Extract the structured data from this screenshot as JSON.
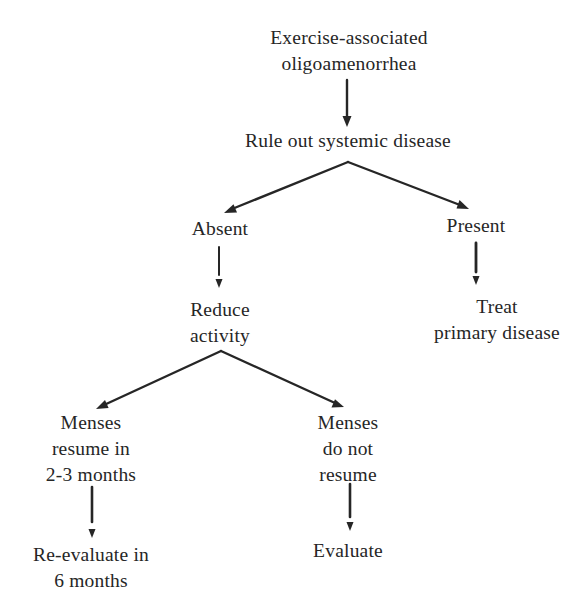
{
  "flowchart": {
    "title": "Exercise-associated oligoamenorrhea",
    "nodes": {
      "start": {
        "lines": [
          "Exercise-associated",
          "oligoamenorrhea"
        ]
      },
      "rule_out": {
        "lines": [
          "Rule out systemic disease"
        ]
      },
      "absent": {
        "lines": [
          "Absent"
        ]
      },
      "present": {
        "lines": [
          "Present"
        ]
      },
      "reduce_activity": {
        "lines": [
          "Reduce",
          "activity"
        ]
      },
      "treat_primary": {
        "lines": [
          "Treat",
          "primary disease"
        ]
      },
      "menses_resume": {
        "lines": [
          "Menses",
          "resume in",
          "2-3 months"
        ]
      },
      "menses_not_resume": {
        "lines": [
          "Menses",
          "do not",
          "resume"
        ]
      },
      "reevaluate": {
        "lines": [
          "Re-evaluate in",
          "6 months"
        ]
      },
      "evaluate": {
        "lines": [
          "Evaluate"
        ]
      }
    },
    "edges": [
      {
        "from": "start",
        "to": "rule_out"
      },
      {
        "from": "rule_out",
        "to": "absent"
      },
      {
        "from": "rule_out",
        "to": "present"
      },
      {
        "from": "absent",
        "to": "reduce_activity"
      },
      {
        "from": "present",
        "to": "treat_primary"
      },
      {
        "from": "reduce_activity",
        "to": "menses_resume"
      },
      {
        "from": "reduce_activity",
        "to": "menses_not_resume"
      },
      {
        "from": "menses_resume",
        "to": "reevaluate"
      },
      {
        "from": "menses_not_resume",
        "to": "evaluate"
      }
    ],
    "colors": {
      "ink": "#262626",
      "background": "#ffffff"
    }
  }
}
